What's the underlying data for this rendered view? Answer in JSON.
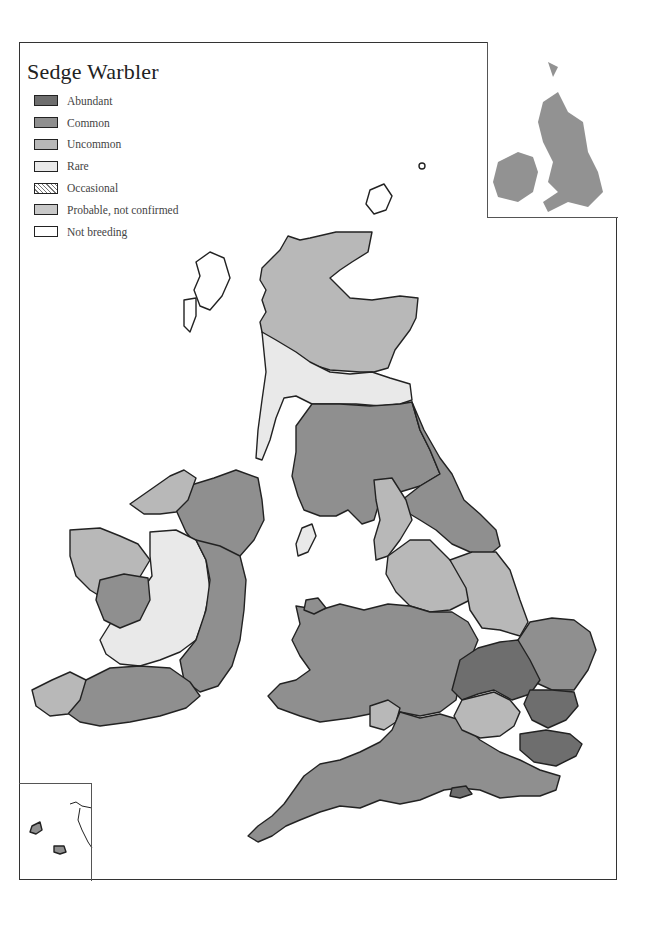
{
  "map": {
    "title": "Sedge Warbler",
    "legend": [
      {
        "label": "Abundant",
        "color": "#6e6e6e",
        "pattern": "solid"
      },
      {
        "label": "Common",
        "color": "#8f8f8f",
        "pattern": "solid"
      },
      {
        "label": "Uncommon",
        "color": "#b8b8b8",
        "pattern": "solid"
      },
      {
        "label": "Rare",
        "color": "#e9e9e9",
        "pattern": "solid"
      },
      {
        "label": "Occasional",
        "color": "#ffffff",
        "pattern": "hatched"
      },
      {
        "label": "Probable, not confirmed",
        "color": "#c8c8c8",
        "pattern": "solid"
      },
      {
        "label": "Not breeding",
        "color": "#ffffff",
        "pattern": "solid"
      }
    ],
    "insets": {
      "top_right": "Distribution grid map of Britain and Ireland",
      "bottom_left": "Channel Islands / Scilly"
    },
    "colors": {
      "abundant": "#6e6e6e",
      "common": "#8f8f8f",
      "uncommon": "#b8b8b8",
      "rare": "#e9e9e9",
      "outline": "#222222"
    }
  }
}
